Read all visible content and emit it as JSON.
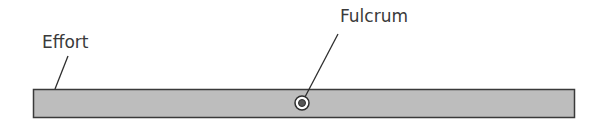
{
  "diagram": {
    "labels": {
      "effort": "Effort",
      "fulcrum": "Fulcrum"
    },
    "colors": {
      "bar_fill": "#bdbdbd",
      "bar_stroke": "#3a3a3a",
      "line": "#2e2e2e"
    }
  }
}
